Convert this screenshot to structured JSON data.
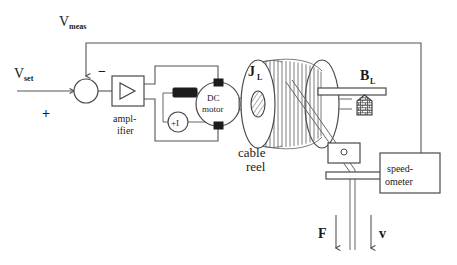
{
  "figure": {
    "background_color": "#ffffff",
    "line_color": "#555555",
    "text_color": "#1a1a1a"
  },
  "labels": {
    "v_meas": "V",
    "v_meas_sub": "meas",
    "v_set": "V",
    "v_set_sub": "set",
    "sum_plus": "+",
    "sum_minus": "−",
    "amplifier_line1": "ampl-",
    "amplifier_line2": "ifier",
    "current_source": "+I",
    "motor_line1": "DC",
    "motor_line2": "motor",
    "inertia": "J",
    "inertia_sub": "L",
    "reel_line1": "cable",
    "reel_line2": "reel",
    "damping": "B",
    "damping_sub": "L",
    "speedometer_line1": "speed-",
    "speedometer_line2": "ometer",
    "force": "F",
    "velocity": "v"
  },
  "components": [
    {
      "id": "summing-junction",
      "type": "circle",
      "label": "summing junction"
    },
    {
      "id": "amplifier",
      "type": "triangle-in-box",
      "label": "ampl-ifier"
    },
    {
      "id": "resistor",
      "type": "filled-rectangle",
      "label": "resistor"
    },
    {
      "id": "current-source",
      "type": "circle-source",
      "label": "+I"
    },
    {
      "id": "dc-motor",
      "type": "circle",
      "label": "DC motor"
    },
    {
      "id": "cable-reel",
      "type": "reel",
      "label": "cable reel"
    },
    {
      "id": "ground-block",
      "type": "hatched-block",
      "label": "B_L ground"
    },
    {
      "id": "cable-guide",
      "type": "rectangle",
      "label": "cable guide"
    },
    {
      "id": "speedometer",
      "type": "rectangle",
      "label": "speed-ometer"
    }
  ],
  "arrows": [
    {
      "id": "force-arrow",
      "label": "F",
      "direction": "down"
    },
    {
      "id": "velocity-arrow",
      "label": "v",
      "direction": "down"
    },
    {
      "id": "setpoint-arrow",
      "label": "V_set input",
      "direction": "right"
    },
    {
      "id": "feedback-arrow",
      "label": "V_meas feedback",
      "direction": "down"
    }
  ]
}
